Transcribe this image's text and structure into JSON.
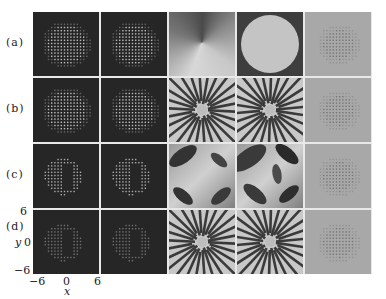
{
  "figure": {
    "rows": [
      {
        "label": "(a)"
      },
      {
        "label": "(b)"
      },
      {
        "label": "(c)"
      },
      {
        "label": "(d)"
      }
    ],
    "columns": 5,
    "panel_types": [
      [
        "dots-disk",
        "dots-disk",
        "conic-phase",
        "disk-phase",
        "grey-dots"
      ],
      [
        "dots-disk",
        "dots-disk",
        "radial-stripes",
        "radial-stripes",
        "grey-dots"
      ],
      [
        "dots-crescent",
        "dots-crescent",
        "vortex-blobs",
        "vortex-blobs",
        "grey-dots"
      ],
      [
        "dots-crescent-faint",
        "dots-crescent-faint",
        "radial-stripes",
        "radial-stripes",
        "grey-dots"
      ]
    ],
    "axes": {
      "y_label": "y",
      "y_ticks": [
        "6",
        "0",
        "−6"
      ],
      "x_label": "x",
      "x_ticks": [
        "−6",
        "0",
        "6"
      ]
    }
  }
}
